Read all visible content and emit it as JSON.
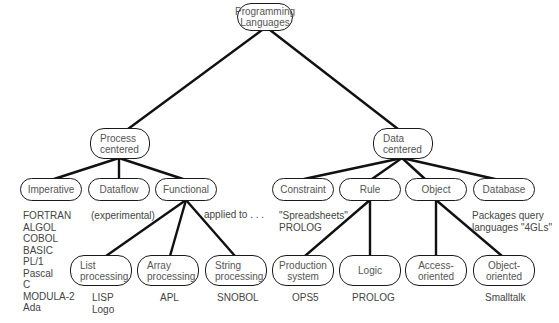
{
  "diagram": {
    "type": "tree",
    "root": {
      "id": "root",
      "label": "Programming\nLanguages"
    },
    "nodes": {
      "root": {
        "label": "Programming\nLanguages"
      },
      "process": {
        "label": "Process\ncentered"
      },
      "data": {
        "label": "Data\ncentered"
      },
      "imperative": {
        "label": "Imperative"
      },
      "dataflow": {
        "label": "Dataflow"
      },
      "functional": {
        "label": "Functional"
      },
      "constraint": {
        "label": "Constraint"
      },
      "rule": {
        "label": "Rule"
      },
      "object": {
        "label": "Object"
      },
      "database": {
        "label": "Database"
      },
      "list": {
        "label": "List\nprocessing"
      },
      "array": {
        "label": "Array\nprocessing"
      },
      "string": {
        "label": "String\nprocessing"
      },
      "production": {
        "label": "Production\nsystem"
      },
      "logic": {
        "label": "Logic"
      },
      "access": {
        "label": "Access-\noriented"
      },
      "objoriented": {
        "label": "Object-\noriented"
      }
    },
    "edges": [
      [
        "root",
        "process"
      ],
      [
        "root",
        "data"
      ],
      [
        "process",
        "imperative"
      ],
      [
        "process",
        "dataflow"
      ],
      [
        "process",
        "functional"
      ],
      [
        "data",
        "constraint"
      ],
      [
        "data",
        "rule"
      ],
      [
        "data",
        "object"
      ],
      [
        "data",
        "database"
      ],
      [
        "functional",
        "list"
      ],
      [
        "functional",
        "array"
      ],
      [
        "functional",
        "string"
      ],
      [
        "rule",
        "production"
      ],
      [
        "rule",
        "logic"
      ],
      [
        "object",
        "access"
      ],
      [
        "object",
        "objoriented"
      ]
    ],
    "annotations": {
      "imperative": "FORTRAN\nALGOL\nCOBOL\nBASIC\nPL/1\nPascal\nC\nMODULA-2\nAda",
      "dataflow": "(experimental)",
      "functional": "applied to . . .",
      "constraint": "\"Spreadsheets\"\nPROLOG",
      "database": "Packages query\nlanguages \"4GLs\"",
      "list": "LISP\nLogo",
      "array": "APL",
      "string": "SNOBOL",
      "production": "OPS5",
      "logic": "PROLOG",
      "objoriented": "Smalltalk"
    }
  }
}
